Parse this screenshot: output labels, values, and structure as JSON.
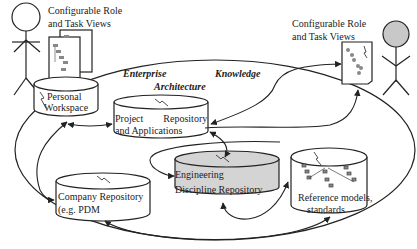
{
  "diagram": {
    "title_line1_left": "Enterprise",
    "title_line1_right": "Knowledge",
    "title_line2": "Architecture",
    "left_actor": {
      "label_line1": "Configurable Role",
      "label_line2": "and Task Views",
      "head_fill": "#ffffff"
    },
    "right_actor": {
      "label_line1": "Configurable Role",
      "label_line2": "and Task Views",
      "head_fill": "#c8c8c8"
    },
    "nodes": [
      {
        "id": "personal-workspace",
        "line1": "Personal",
        "line2": "Workspace",
        "fill": "#ffffff"
      },
      {
        "id": "project-repository",
        "line1": "Project        Repository",
        "line2": "and Applications",
        "fill": "#ffffff"
      },
      {
        "id": "engineering-repository",
        "line1": "Engineering",
        "line2": "Discipline  Repository",
        "fill": "#d4d4d4"
      },
      {
        "id": "company-repository",
        "line1": "Company Repository",
        "line2": "(e.g. PDM",
        "fill": "#ffffff"
      },
      {
        "id": "reference-models",
        "line1": "Reference models,",
        "line2": "standards",
        "fill": "#ffffff"
      }
    ],
    "colors": {
      "stroke": "#222222",
      "shaded_fill": "#d4d4d4",
      "background": "#ffffff"
    }
  }
}
